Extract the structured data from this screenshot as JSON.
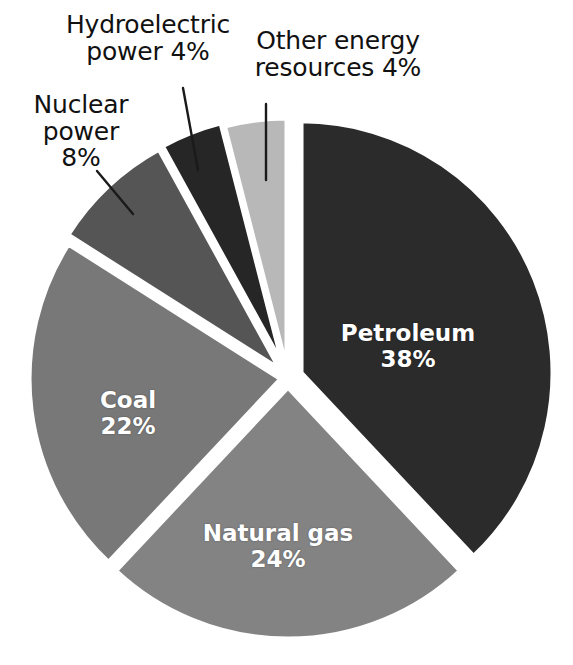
{
  "chart_data": {
    "type": "pie",
    "title": "",
    "subtitle": "",
    "units": "percent",
    "legend_position": "none",
    "grid": false,
    "categories": [
      "Petroleum",
      "Natural gas",
      "Coal",
      "Nuclear power",
      "Hydroelectric power",
      "Other energy resources"
    ],
    "values": [
      38,
      24,
      22,
      8,
      4,
      4
    ],
    "total": 100,
    "slices": [
      {
        "name": "Petroleum",
        "value": 38,
        "percent_text": "38%",
        "color": "#2b2b2b",
        "label_placement": "inside",
        "label_lines": [
          "Petroleum",
          "38%"
        ],
        "start_angle_deg": 0,
        "end_angle_deg": 136.8,
        "exploded": true,
        "explode_offset_px": 14
      },
      {
        "name": "Natural gas",
        "value": 24,
        "percent_text": "24%",
        "color": "#838383",
        "label_placement": "inside",
        "label_lines": [
          "Natural gas",
          "24%"
        ],
        "start_angle_deg": 136.8,
        "end_angle_deg": 223.2,
        "exploded": true,
        "explode_offset_px": 9
      },
      {
        "name": "Coal",
        "value": 22,
        "percent_text": "22%",
        "color": "#787878",
        "label_placement": "inside",
        "label_lines": [
          "Coal",
          "22%"
        ],
        "start_angle_deg": 223.2,
        "end_angle_deg": 302.4,
        "exploded": true,
        "explode_offset_px": 7
      },
      {
        "name": "Nuclear power",
        "value": 8,
        "percent_text": "8%",
        "color": "#555555",
        "label_placement": "callout",
        "label_lines": [
          "Nuclear",
          "power",
          "8%"
        ],
        "start_angle_deg": 302.4,
        "end_angle_deg": 331.2,
        "exploded": true,
        "explode_offset_px": 11
      },
      {
        "name": "Hydroelectric power",
        "value": 4,
        "percent_text": "4%",
        "color": "#262626",
        "label_placement": "callout",
        "label_lines": [
          "Hydroelectric",
          "power 4%"
        ],
        "start_angle_deg": 331.2,
        "end_angle_deg": 345.6,
        "exploded": true,
        "explode_offset_px": 12
      },
      {
        "name": "Other energy resources",
        "value": 4,
        "percent_text": "4%",
        "color": "#b8b8b8",
        "label_placement": "callout",
        "label_lines": [
          "Other energy",
          "resources 4%"
        ],
        "start_angle_deg": 345.6,
        "end_angle_deg": 360,
        "exploded": true,
        "explode_offset_px": 8
      }
    ]
  },
  "labels": {
    "hydroelectric": {
      "line1": "Hydroelectric",
      "line2": "power 4%"
    },
    "other_energy": {
      "line1": "Other energy",
      "line2": "resources 4%"
    },
    "nuclear": {
      "line1": "Nuclear",
      "line2": "power",
      "line3": "8%"
    },
    "petroleum": {
      "line1": "Petroleum",
      "line2": "38%"
    },
    "coal": {
      "line1": "Coal",
      "line2": "22%"
    },
    "natural_gas": {
      "line1": "Natural gas",
      "line2": "24%"
    }
  },
  "style": {
    "background": "#ffffff",
    "slice_gap_color": "#ffffff",
    "inside_label_color": "#ffffff",
    "callout_label_color": "#111111",
    "leader_line_color": "#1a1a1a"
  },
  "geometry": {
    "center_x": 288,
    "center_y": 378,
    "radius": 252
  }
}
